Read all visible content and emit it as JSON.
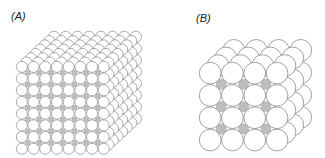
{
  "figure": {
    "panels": [
      {
        "label": "(A)",
        "description": "Cubic lattice packing of spheres, 8 x 8 x 8",
        "grid": 8,
        "front_x": 16,
        "front_y": 61,
        "diameter": 11.7,
        "depth_dx": 4.6,
        "depth_dy": -4.3
      },
      {
        "label": "(B)",
        "description": "Cubic lattice packing of spheres, 4 x 4 x 4",
        "grid": 4,
        "front_x": 199,
        "front_y": 62,
        "diameter": 22.3,
        "depth_dx": 7.9,
        "depth_dy": -7.6
      }
    ],
    "colors": {
      "sphere_fill": "#ffffff",
      "sphere_stroke": "#8a8a8a",
      "interstitial": "#bdbdbd"
    }
  }
}
